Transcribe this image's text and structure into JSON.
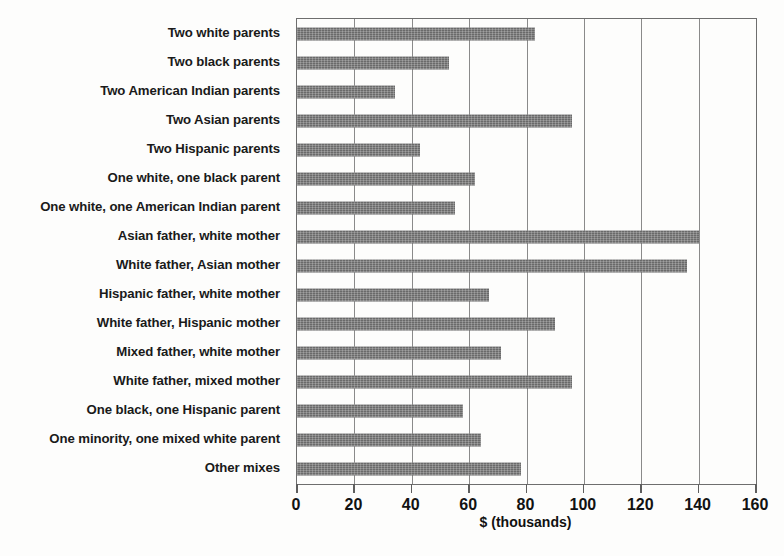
{
  "chart_data": {
    "type": "bar",
    "orientation": "horizontal",
    "title": "",
    "subtitle": "",
    "xlabel": "$ (thousands)",
    "ylabel": "",
    "xlim": [
      0,
      160
    ],
    "xticks": [
      0,
      20,
      40,
      60,
      80,
      100,
      120,
      140,
      160
    ],
    "xtick_labels": [
      "0",
      "20",
      "40",
      "60",
      "80",
      "100",
      "120",
      "140",
      "160"
    ],
    "grid": "vertical",
    "legend": "none",
    "bar_color": "#7b7b7b",
    "categories": [
      "Two white parents",
      "Two black parents",
      "Two American Indian parents",
      "Two Asian parents",
      "Two Hispanic parents",
      "One white, one black parent",
      "One white, one American Indian parent",
      "Asian father, white mother",
      "White father, Asian mother",
      "Hispanic father, white mother",
      "White father, Hispanic mother",
      "Mixed father, white mother",
      "White father, mixed mother",
      "One black, one Hispanic parent",
      "One minority, one mixed white parent",
      "Other mixes"
    ],
    "values": [
      83,
      53,
      34,
      96,
      43,
      62,
      55,
      140,
      136,
      67,
      90,
      71,
      96,
      58,
      64,
      78
    ]
  }
}
